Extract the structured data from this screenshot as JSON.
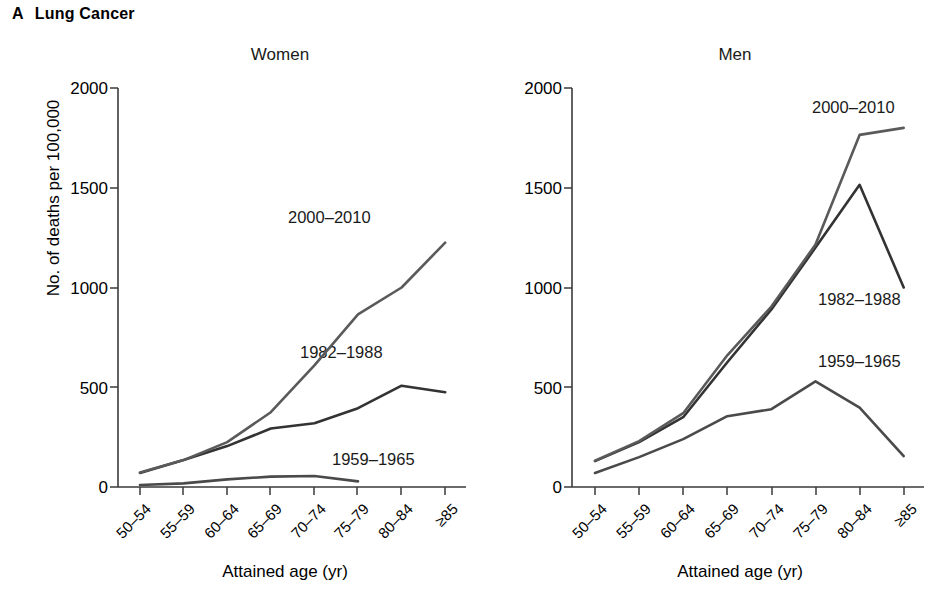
{
  "figure": {
    "panel_letter": "A",
    "panel_title": "Lung Cancer",
    "ylabel": "No. of deaths per 100,000",
    "xlabel_left": "Attained age (yr)",
    "xlabel_right": "Attained age (yr)"
  },
  "panels": {
    "left": {
      "title": "Women"
    },
    "right": {
      "title": "Men"
    }
  },
  "series_labels": {
    "s2000_left": "2000–2010",
    "s1982_left": "1982–1988",
    "s1959_left": "1959–1965",
    "s2000_right": "2000–2010",
    "s1982_right": "1982–1988",
    "s1959_right": "1959–1965"
  },
  "yticks": [
    "0",
    "500",
    "1000",
    "1500",
    "2000"
  ],
  "xticks": [
    "50–54",
    "55–59",
    "60–64",
    "65–69",
    "70–74",
    "75–79",
    "80–84",
    "≥85"
  ],
  "colors": {
    "line_2000_2010": "#5a5a5a",
    "line_1982_1988": "#333333",
    "line_1959_1965": "#4a4a4a",
    "axis": "#3a3a3a",
    "text": "#000000",
    "background": "#ffffff"
  },
  "chart_data": {
    "type": "line",
    "xlabel": "Attained age (yr)",
    "ylabel": "No. of deaths per 100,000",
    "ylim": [
      0,
      2000
    ],
    "yticks": [
      0,
      500,
      1000,
      1500,
      2000
    ],
    "categories": [
      "50-54",
      "55-59",
      "60-64",
      "65-69",
      "70-74",
      "75-79",
      "80-84",
      ">=85"
    ],
    "grid": false,
    "legend": "inline-annotations",
    "panels": [
      {
        "panel": "Women",
        "series": [
          {
            "name": "1959-1965",
            "values": [
              10,
              18,
              38,
              52,
              55,
              28,
              null,
              null
            ]
          },
          {
            "name": "1982-1988",
            "values": [
              70,
              135,
              205,
              293,
              320,
              395,
              508,
              475
            ]
          },
          {
            "name": "2000-2010",
            "values": [
              72,
              135,
              225,
              375,
              610,
              865,
              1000,
              1225
            ]
          }
        ]
      },
      {
        "panel": "Men",
        "series": [
          {
            "name": "1959-1965",
            "values": [
              70,
              150,
              240,
              355,
              390,
              530,
              398,
              155
            ]
          },
          {
            "name": "1982-1988",
            "values": [
              130,
              225,
              350,
              625,
              890,
              1200,
              1515,
              1000
            ]
          },
          {
            "name": "2000-2010",
            "values": [
              132,
              230,
              370,
              660,
              905,
              1215,
              1765,
              1800
            ]
          }
        ]
      }
    ]
  }
}
